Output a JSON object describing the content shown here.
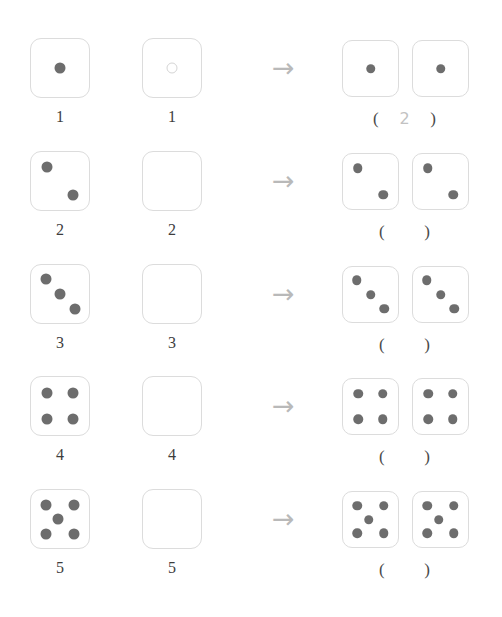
{
  "page": {
    "top_faint_text": "                                   ",
    "arrow_glyph": "→",
    "colors": {
      "pip": "#6d6d6d",
      "die_border": "#dcdcdc",
      "arrow": "#b9b9b9",
      "label_text": "#3d3d3d",
      "answer_text": "#4a4a4a",
      "filled_answer_text": "#c2c2c2",
      "background": "#ffffff"
    },
    "paren_open": "(",
    "paren_close": ")"
  },
  "rows": [
    {
      "id": "row-1",
      "left_die": {
        "pips": 1,
        "style": "filled"
      },
      "left_label": "1",
      "right_die": {
        "pips": 1,
        "style": "hollow"
      },
      "right_label": "1",
      "result_dice": [
        {
          "pips": 1
        },
        {
          "pips": 1
        }
      ],
      "answer_value": "2",
      "answer_filled": true
    },
    {
      "id": "row-2",
      "left_die": {
        "pips": 2,
        "style": "filled"
      },
      "left_label": "2",
      "right_die": {
        "pips": 0,
        "style": "empty"
      },
      "right_label": "2",
      "result_dice": [
        {
          "pips": 2
        },
        {
          "pips": 2
        }
      ],
      "answer_value": "",
      "answer_filled": false
    },
    {
      "id": "row-3",
      "left_die": {
        "pips": 3,
        "style": "filled"
      },
      "left_label": "3",
      "right_die": {
        "pips": 0,
        "style": "empty"
      },
      "right_label": "3",
      "result_dice": [
        {
          "pips": 3
        },
        {
          "pips": 3
        }
      ],
      "answer_value": "",
      "answer_filled": false
    },
    {
      "id": "row-4",
      "left_die": {
        "pips": 4,
        "style": "filled"
      },
      "left_label": "4",
      "right_die": {
        "pips": 0,
        "style": "empty"
      },
      "right_label": "4",
      "result_dice": [
        {
          "pips": 4
        },
        {
          "pips": 4
        }
      ],
      "answer_value": "",
      "answer_filled": false
    },
    {
      "id": "row-5",
      "left_die": {
        "pips": 5,
        "style": "filled"
      },
      "left_label": "5",
      "right_die": {
        "pips": 0,
        "style": "empty"
      },
      "right_label": "5",
      "result_dice": [
        {
          "pips": 5
        },
        {
          "pips": 5
        }
      ],
      "answer_value": "",
      "answer_filled": false
    }
  ]
}
